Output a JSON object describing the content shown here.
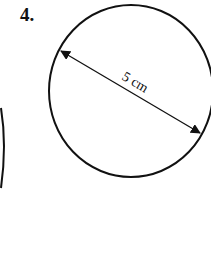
{
  "problem": {
    "number": "4."
  },
  "figure": {
    "shape": "circle",
    "dimension_label": "5 cm",
    "dimension_type": "diameter"
  }
}
